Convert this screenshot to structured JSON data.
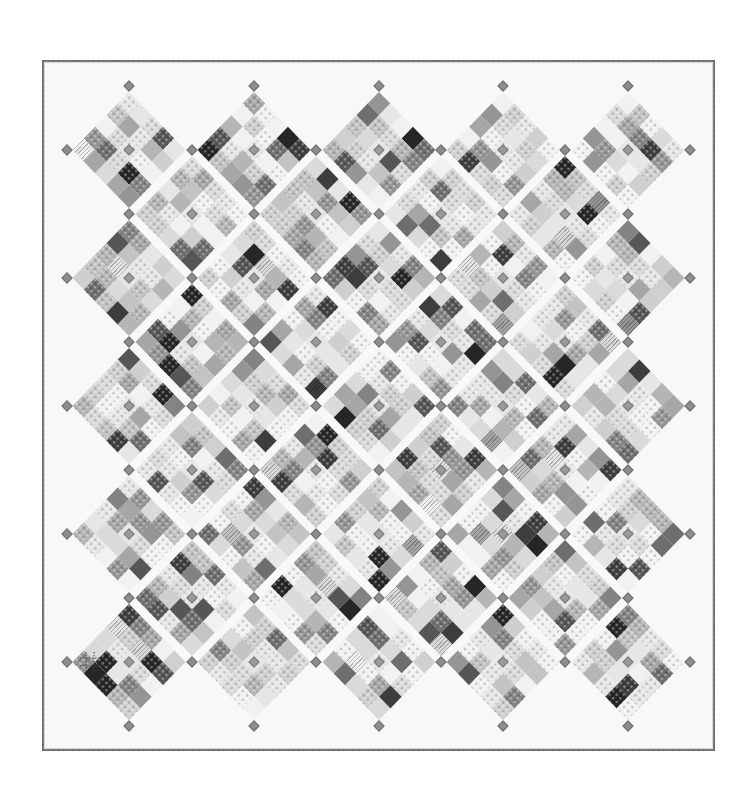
{
  "image": {
    "description": "Grayscale on-point patchwork quilt diagram",
    "width": 750,
    "height": 798,
    "background": "#ffffff"
  },
  "quilt": {
    "border": {
      "left": 42,
      "top": 60,
      "width": 673,
      "height": 691,
      "color": "#7c7c7c",
      "fill": "#f8f8f8"
    },
    "lattice": {
      "origin_x": 67,
      "origin_y": 86,
      "step_x": 62.3,
      "step_y": 64
    },
    "block": {
      "grid": 5,
      "side": 80,
      "gap_color": "#f8f8f8"
    },
    "palette": [
      "#f1f1f1",
      "#e6e6e6",
      "#dadada",
      "#cfcfcf",
      "#c3c3c3",
      "#b5b5b5",
      "#a6a6a6",
      "#959595",
      "#838383",
      "#6e6e6e",
      "#565656",
      "#3d3d3d",
      "#262626"
    ],
    "pattern_seed": 1379,
    "blocks": [
      {
        "a": 1,
        "b": 1
      },
      {
        "a": 3,
        "b": 1
      },
      {
        "a": 5,
        "b": 1
      },
      {
        "a": 7,
        "b": 1
      },
      {
        "a": 9,
        "b": 1
      },
      {
        "a": 2,
        "b": 2
      },
      {
        "a": 4,
        "b": 2
      },
      {
        "a": 6,
        "b": 2
      },
      {
        "a": 8,
        "b": 2
      },
      {
        "a": 1,
        "b": 3
      },
      {
        "a": 3,
        "b": 3
      },
      {
        "a": 5,
        "b": 3
      },
      {
        "a": 7,
        "b": 3
      },
      {
        "a": 9,
        "b": 3
      },
      {
        "a": 2,
        "b": 4
      },
      {
        "a": 4,
        "b": 4
      },
      {
        "a": 6,
        "b": 4
      },
      {
        "a": 8,
        "b": 4
      },
      {
        "a": 1,
        "b": 5
      },
      {
        "a": 3,
        "b": 5
      },
      {
        "a": 5,
        "b": 5
      },
      {
        "a": 7,
        "b": 5
      },
      {
        "a": 9,
        "b": 5
      },
      {
        "a": 2,
        "b": 6
      },
      {
        "a": 4,
        "b": 6
      },
      {
        "a": 6,
        "b": 6
      },
      {
        "a": 8,
        "b": 6
      },
      {
        "a": 1,
        "b": 7
      },
      {
        "a": 3,
        "b": 7
      },
      {
        "a": 5,
        "b": 7
      },
      {
        "a": 7,
        "b": 7
      },
      {
        "a": 9,
        "b": 7
      },
      {
        "a": 2,
        "b": 8
      },
      {
        "a": 4,
        "b": 8
      },
      {
        "a": 6,
        "b": 8
      },
      {
        "a": 8,
        "b": 8
      },
      {
        "a": 1,
        "b": 9
      },
      {
        "a": 3,
        "b": 9
      },
      {
        "a": 5,
        "b": 9
      },
      {
        "a": 7,
        "b": 9
      },
      {
        "a": 9,
        "b": 9
      }
    ],
    "cornerstones": {
      "size": 8,
      "color": "#8d8d8d",
      "rule": "all lattice points with a+b odd within 0..10, plus every block center"
    },
    "guide_icon": {
      "name": "quilting-guide-crosshatch",
      "x": 79,
      "y": 651,
      "size": 22
    }
  }
}
